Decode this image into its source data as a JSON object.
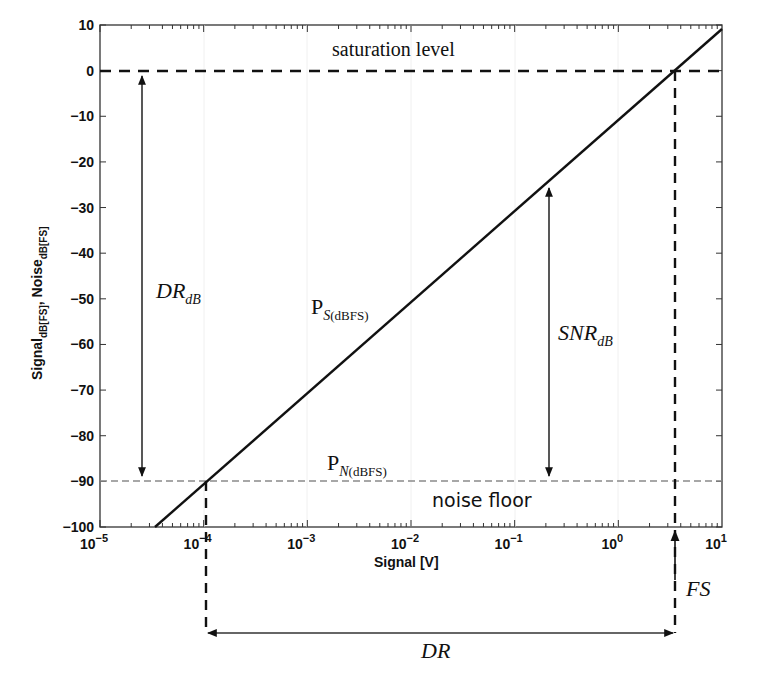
{
  "chart_data": {
    "type": "line",
    "title": "",
    "xlabel": "Signal [V]",
    "ylabel": "Signal_dB[FS], Noise_dB[FS]",
    "xscale": "log",
    "xlim": [
      1e-05,
      10
    ],
    "ylim": [
      -100,
      10
    ],
    "grid": false,
    "x_tick_labels": [
      "10^-5",
      "10^-4",
      "10^-3",
      "10^-2",
      "10^-1",
      "10^0",
      "10^1"
    ],
    "y_tick_labels": [
      "10",
      "0",
      "-10",
      "-20",
      "-30",
      "-40",
      "-50",
      "-60",
      "-70",
      "-80",
      "-90",
      "-100"
    ],
    "series": [
      {
        "name": "P_S(dBFS)",
        "style": "solid black",
        "x": [
          3.48e-05,
          0.000111,
          0.00111,
          0.0111,
          0.111,
          3.5,
          10
        ],
        "y": [
          -100,
          -90,
          -70,
          -50,
          -30,
          0,
          9.1
        ]
      },
      {
        "name": "saturation level",
        "style": "dashed black",
        "x": [
          1e-05,
          10
        ],
        "y": [
          0,
          0
        ]
      },
      {
        "name": "P_N(dBFS) noise floor",
        "style": "dashed gray",
        "x": [
          1e-05,
          10
        ],
        "y": [
          -89.5,
          -89.5
        ]
      }
    ],
    "annotations": [
      {
        "text": "saturation level",
        "x": 0.0018,
        "y": 5
      },
      {
        "text": "noise floor",
        "x": 0.018,
        "y": -95
      },
      {
        "text": "DR_dB",
        "type": "double-arrow",
        "x": 3e-05,
        "y_from": 0,
        "y_to": -89.5
      },
      {
        "text": "SNR_dB",
        "type": "double-arrow",
        "x": 0.2,
        "y_from": -25,
        "y_to": -89.5
      },
      {
        "text": "P_S(dBFS)",
        "x": 0.0015,
        "y": -52
      },
      {
        "text": "P_N(dBFS)",
        "x": 0.0015,
        "y": -86
      },
      {
        "text": "FS",
        "type": "arrow-up",
        "x": 3.5
      },
      {
        "text": "DR",
        "type": "double-arrow-horizontal",
        "x_from": 0.000111,
        "x_to": 3.5
      }
    ],
    "legend": "none"
  },
  "labels": {
    "saturation": "saturation level",
    "noise_floor": "noise floor",
    "dr_db_main": "DR",
    "dr_db_sub": "dB",
    "snr_db_main": "SNR",
    "snr_db_sub": "dB",
    "ps_main": "P",
    "ps_sub_italic": "S",
    "ps_sub_rest": "(dBFS)",
    "pn_main": "P",
    "pn_sub_italic": "N",
    "pn_sub_rest": "(dBFS)",
    "fs": "FS",
    "dr": "DR",
    "xlabel": "Signal [V]",
    "ylabel_a": "Signal",
    "ylabel_a_sub": "dB[FS]",
    "ylabel_comma": ",",
    "ylabel_b": " Noise",
    "ylabel_b_sub": "dB[FS]"
  },
  "colors": {
    "line": "#111111",
    "noise": "#8a8a8a",
    "frame": "#333333"
  }
}
